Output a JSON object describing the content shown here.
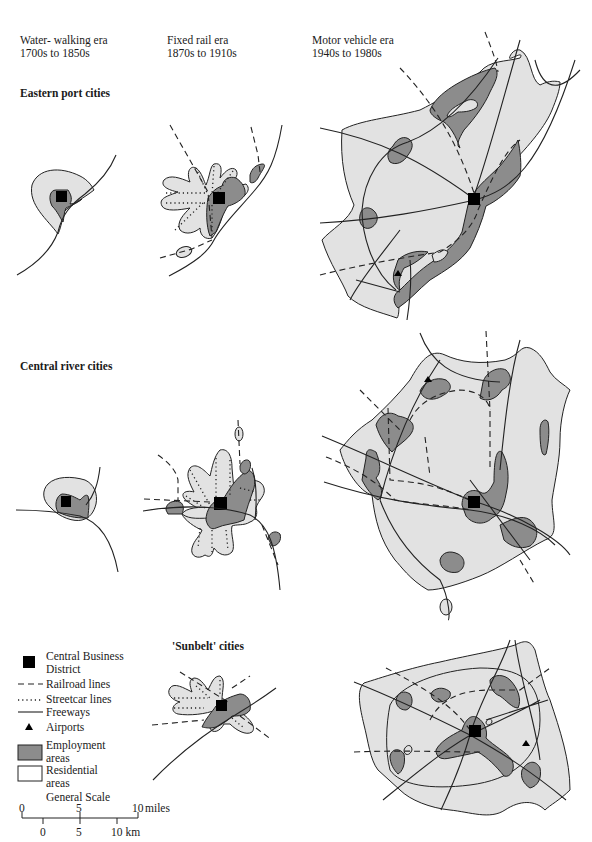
{
  "columns": [
    {
      "title": "Water- walking era",
      "years": "1700s to 1850s"
    },
    {
      "title": "Fixed rail era",
      "years": "1870s to 1910s"
    },
    {
      "title": "Motor vehicle era",
      "years": "1940s to 1980s"
    }
  ],
  "rows": [
    {
      "title": "Eastern port cities"
    },
    {
      "title": "Central river cities"
    },
    {
      "title": "'Sunbelt' cities"
    }
  ],
  "legend": {
    "cbd": {
      "line1": "Central Business",
      "line2": "District",
      "icon": "black-square"
    },
    "railroad": {
      "label": "Railroad lines",
      "icon": "dashed-line"
    },
    "streetcar": {
      "label": "Streetcar lines",
      "icon": "dotted-line"
    },
    "freeways": {
      "label": "Freeways",
      "icon": "solid-line"
    },
    "airports": {
      "label": "Airports",
      "icon": "triangle"
    },
    "employment": {
      "line1": "Employment",
      "line2": "areas",
      "icon": "dark-gray-box"
    },
    "residential": {
      "line1": "Residential",
      "line2": "areas",
      "icon": "white-box"
    }
  },
  "scale": {
    "title": "General Scale",
    "miles": {
      "ticks": [
        "0",
        "5",
        "10"
      ],
      "unit": "miles"
    },
    "km": {
      "ticks": [
        "0",
        "5",
        "10 km"
      ]
    }
  },
  "colors": {
    "residential_fill": "#e2e2e2",
    "employment_fill": "#8c8c8c",
    "cbd": "#000000",
    "line": "#222222"
  }
}
